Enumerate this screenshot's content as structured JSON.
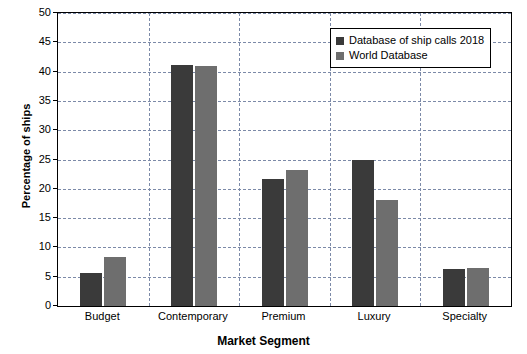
{
  "chart_data": {
    "type": "bar",
    "title": "",
    "xlabel": "Market Segment",
    "ylabel": "Percentage of ships",
    "categories": [
      "Budget",
      "Contemporary",
      "Premium",
      "Luxury",
      "Specialty"
    ],
    "series": [
      {
        "name": "Database of ship calls 2018",
        "color": "#3a3a3a",
        "values": [
          5.7,
          41.2,
          21.7,
          24.9,
          6.3
        ]
      },
      {
        "name": "World Database",
        "color": "#6e6e6e",
        "values": [
          8.3,
          41.0,
          23.2,
          18.1,
          6.5
        ]
      }
    ],
    "ylim": [
      0,
      50
    ],
    "yticks": [
      0,
      5,
      10,
      15,
      20,
      25,
      30,
      35,
      40,
      45,
      50
    ],
    "ytick_labels": [
      "0",
      "5",
      "10",
      "15",
      "20",
      "25",
      "30",
      "35",
      "40",
      "45",
      "50"
    ],
    "grid": "horizontal-and-vertical-dashed",
    "legend_position": "top-right"
  }
}
